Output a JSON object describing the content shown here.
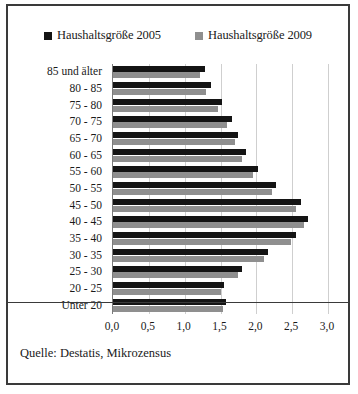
{
  "figure": {
    "source_caption": "Quelle: Destatis, Mikrozensus",
    "border_color": "#3a3a3a",
    "background": "#ffffff"
  },
  "legend": {
    "position": "top-center",
    "entries": [
      {
        "label": "Haushaltsgröße 2005",
        "color": "#141414",
        "marker": "square-marker"
      },
      {
        "label": "Haushaltsgröße 2009",
        "color": "#8f8f8f",
        "marker": "square-marker"
      }
    ]
  },
  "chart_data": {
    "type": "bar",
    "orientation": "horizontal",
    "title": "",
    "xlabel": "",
    "ylabel": "",
    "xlim": [
      0,
      3
    ],
    "ylim": null,
    "grid": true,
    "legend_position": "top-center",
    "xticks": [
      "0,0",
      "0,5",
      "1,0",
      "1,5",
      "2,0",
      "2,5",
      "3,0"
    ],
    "xtick_values": [
      0,
      0.5,
      1.0,
      1.5,
      2.0,
      2.5,
      3.0
    ],
    "categories": [
      "85 und älter",
      "80 - 85",
      "75 - 80",
      "70 - 75",
      "65 - 70",
      "60 - 65",
      "55 - 60",
      "50 - 55",
      "45 - 50",
      "40 - 45",
      "35 - 40",
      "30 - 35",
      "25 - 30",
      "20 - 25",
      "Unter 20"
    ],
    "series": [
      {
        "name": "Haushaltsgröße 2005",
        "color": "#141414",
        "values": [
          1.28,
          1.37,
          1.52,
          1.66,
          1.74,
          1.85,
          2.02,
          2.28,
          2.62,
          2.72,
          2.55,
          2.16,
          1.8,
          1.55,
          1.58
        ]
      },
      {
        "name": "Haushaltsgröße 2009",
        "color": "#8f8f8f",
        "values": [
          1.22,
          1.3,
          1.46,
          1.59,
          1.7,
          1.8,
          1.96,
          2.22,
          2.55,
          2.66,
          2.48,
          2.1,
          1.74,
          1.5,
          1.53
        ]
      }
    ]
  }
}
